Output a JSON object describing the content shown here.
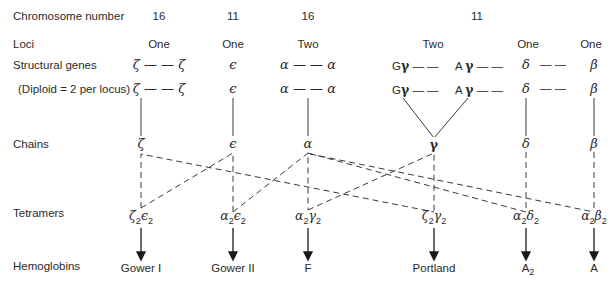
{
  "row_labels": {
    "chromosome": "Chromosome number",
    "loci": "Loci",
    "structural": "Structural genes",
    "diploid": "(Diploid = 2 per locus)",
    "chains": "Chains",
    "tetramers": "Tetramers",
    "hemoglobins": "Hemoglobins"
  },
  "chromosomes": [
    "16",
    "11",
    "16",
    "11"
  ],
  "loci": [
    "One",
    "One",
    "Two",
    "Two",
    "One",
    "One"
  ],
  "genes": {
    "zeta": "ζ — — ζ",
    "epsilon": "ϵ",
    "alpha": "α — — α",
    "G": "G",
    "gamma": "γ",
    "dash": "— —",
    "A": "A",
    "delta": "δ",
    "beta": "β"
  },
  "chains": [
    "ζ",
    "ϵ",
    "α",
    "γ",
    "δ",
    "β"
  ],
  "tetramers": [
    {
      "a": "ζ",
      "b": "ϵ",
      "n": "2"
    },
    {
      "a": "α",
      "b": "ϵ",
      "n": "2"
    },
    {
      "a": "α",
      "b": "γ",
      "n": "2"
    },
    {
      "a": "ζ",
      "b": "γ",
      "n": "2"
    },
    {
      "a": "α",
      "b": "δ",
      "n": "2"
    },
    {
      "a": "α",
      "b": "β",
      "n": "2"
    }
  ],
  "hemoglobins": [
    "Gower I",
    "Gower II",
    "F",
    "Portland",
    "A",
    "A"
  ],
  "hemoglobin_A2_sub": "2",
  "colors": {
    "ink": "#2a2a2a",
    "background": "#ffffff"
  }
}
